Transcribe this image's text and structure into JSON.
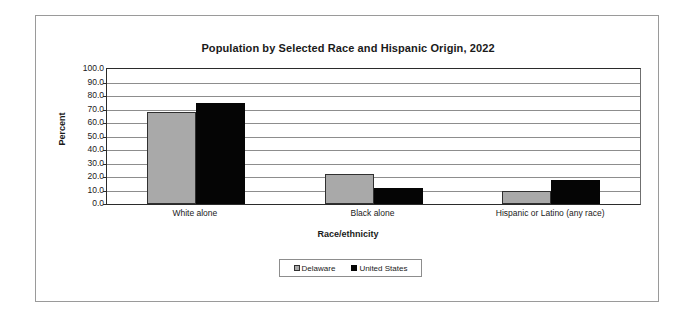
{
  "chart_data": {
    "type": "bar",
    "title": "Population by Selected Race and Hispanic Origin, 2022",
    "xlabel": "Race/ethnicity",
    "ylabel": "Percent",
    "categories": [
      "White alone",
      "Black alone",
      "Hispanic or Latino (any race)"
    ],
    "series": [
      {
        "name": "Delaware",
        "color": "#a9a9a9",
        "values": [
          68.0,
          22.0,
          10.0
        ]
      },
      {
        "name": "United States",
        "color": "#050505",
        "values": [
          75.0,
          12.0,
          18.0
        ]
      }
    ],
    "ylim": [
      0,
      100
    ],
    "ytick_step": 10,
    "ytick_labels": [
      "100.0",
      "90.0",
      "80.0",
      "70.0",
      "60.0",
      "50.0",
      "40.0",
      "30.0",
      "20.0",
      "10.0",
      "0.0"
    ],
    "grid": true,
    "legend_position": "bottom-center"
  }
}
